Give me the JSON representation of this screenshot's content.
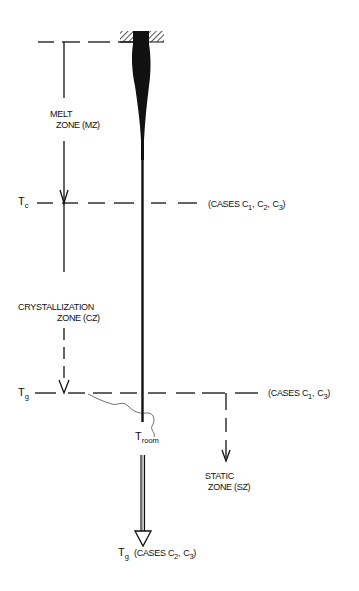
{
  "diagram": {
    "title": "",
    "levels": {
      "top": {
        "label": ""
      },
      "tc": {
        "symbol": "T",
        "subscript": "c",
        "cases_label": "(CASES C",
        "cases": [
          "1",
          "2",
          "3"
        ]
      },
      "tg": {
        "symbol": "T",
        "subscript": "g",
        "cases_label": "(CASES C",
        "cases": [
          "1",
          "3"
        ]
      },
      "troom": {
        "symbol": "T",
        "subscript": "room"
      },
      "tg_bottom": {
        "symbol": "T",
        "subscript": "g",
        "cases_label": "(CASES C",
        "cases": [
          "2",
          "3"
        ]
      }
    },
    "zones": {
      "melt": {
        "line1": "MELT",
        "line2": "ZONE (MZ)"
      },
      "crystallization": {
        "line1": "CRYSTALLIZATION",
        "line2": "ZONE (CZ)"
      },
      "static": {
        "line1": "STATIC",
        "line2": "ZONE (SZ)"
      }
    },
    "text": {
      "tc_cases": "(CASES C",
      "comma": ",",
      "close": ")",
      "tc_sub1": "1",
      "tc_sub2": "2",
      "tc_sub3": "3",
      "tg_sub1": "1",
      "tg_sub3": "3",
      "tgb_sub2": "2",
      "tgb_sub3": "3",
      "T": "T",
      "C": "C",
      "sub_c": "c",
      "sub_g": "g",
      "sub_room": "room"
    },
    "colors": {
      "ink": "#111111",
      "background": "#ffffff"
    }
  }
}
